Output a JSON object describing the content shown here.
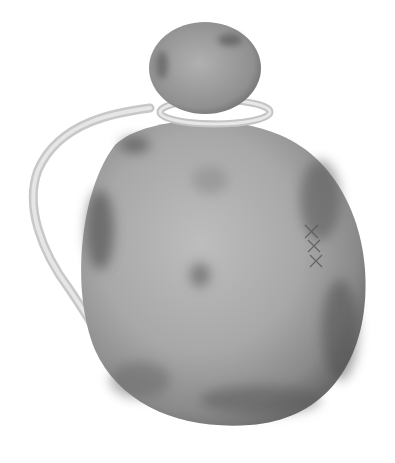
{
  "image": {
    "subject": "gourd canteen with stopper and cord handle",
    "alt": "Grayscale photograph of a dried gourd vessel with a round stopper and a twisted cord handle",
    "colors": {
      "background": "#ffffff",
      "body_light": "#b8b8b8",
      "body_mid": "#9a9a9a",
      "body_dark": "#5e5e5e",
      "cord": "#d8d8d8"
    }
  }
}
